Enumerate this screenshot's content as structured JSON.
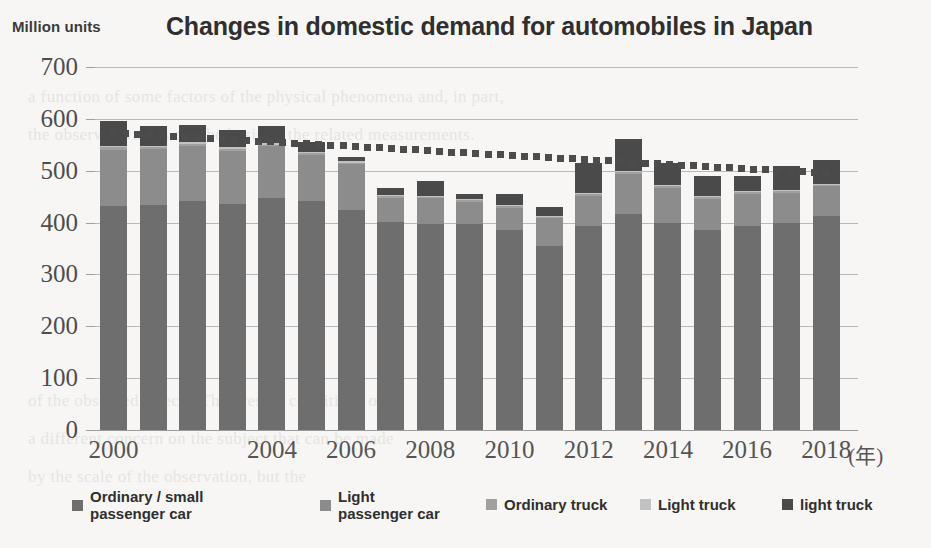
{
  "header": {
    "unit_label": "Million units",
    "title": "Changes in domestic demand for automobiles in Japan"
  },
  "axis": {
    "x_unit_note": "(年)",
    "y_ticks": [
      "700",
      "600",
      "500",
      "400",
      "300",
      "200",
      "100",
      "0"
    ],
    "x_ticks": [
      "2000",
      "2004",
      "2006",
      "2008",
      "2010",
      "2012",
      "2014",
      "2016",
      "2018"
    ]
  },
  "legend": {
    "items": [
      {
        "label": "Ordinary / small\npassenger car",
        "color": "#6e6e6e"
      },
      {
        "label": "Light\npassenger car",
        "color": "#8c8c8c"
      },
      {
        "label": "Ordinary truck",
        "color": "#a0a0a0"
      },
      {
        "label": "Light truck",
        "color": "#c2c2c2"
      },
      {
        "label": "light truck",
        "color": "#4a4a4a"
      }
    ]
  },
  "colors": {
    "background": "#f7f6f4",
    "gridline": "#b9b9b9",
    "trendline": "#4c4c4c",
    "title": "#2f2f2f"
  },
  "chart_data": {
    "type": "bar",
    "stacked": true,
    "title": "Changes in domestic demand for automobiles in Japan",
    "xlabel": "(年)",
    "ylabel": "Million units",
    "ylim": [
      0,
      700
    ],
    "ytick_step": 100,
    "grid": true,
    "legend_position": "bottom",
    "categories": [
      "2000",
      "2001",
      "2002",
      "2003",
      "2004",
      "2005",
      "2006",
      "2007",
      "2008",
      "2009",
      "2010",
      "2011",
      "2012",
      "2013",
      "2014",
      "2015",
      "2016",
      "2017",
      "2018"
    ],
    "series": [
      {
        "name": "Ordinary / small passenger car",
        "color": "#6e6e6e",
        "values": [
          431,
          434,
          441,
          436,
          447,
          441,
          424,
          401,
          398,
          397,
          386,
          355,
          394,
          417,
          400,
          385,
          393,
          399,
          413
        ]
      },
      {
        "name": "Light passenger car",
        "color": "#8c8c8c",
        "values": [
          109,
          107,
          107,
          102,
          100,
          90,
          88,
          47,
          49,
          43,
          43,
          53,
          58,
          77,
          67,
          61,
          63,
          58,
          57
        ]
      },
      {
        "name": "Ordinary truck",
        "color": "#a0a0a0",
        "values": [
          5,
          4,
          4,
          4,
          3,
          3,
          3,
          3,
          3,
          3,
          3,
          3,
          3,
          3,
          3,
          3,
          3,
          3,
          3
        ]
      },
      {
        "name": "Light truck",
        "color": "#c2c2c2",
        "values": [
          3,
          3,
          3,
          3,
          3,
          3,
          3,
          2,
          2,
          2,
          2,
          2,
          2,
          2,
          2,
          2,
          2,
          2,
          2
        ]
      },
      {
        "name": "light truck",
        "color": "#4a4a4a",
        "values": [
          48,
          38,
          33,
          33,
          33,
          18,
          9,
          14,
          29,
          10,
          21,
          17,
          58,
          62,
          43,
          38,
          28,
          47,
          45
        ]
      }
    ],
    "totals": [
      596,
      586,
      588,
      578,
      586,
      555,
      527,
      467,
      481,
      455,
      455,
      430,
      515,
      561,
      515,
      489,
      489,
      509,
      520
    ],
    "trendline": {
      "type": "dotted-trend",
      "start_value": 573,
      "end_value": 495,
      "color": "#4c4c4c"
    }
  }
}
